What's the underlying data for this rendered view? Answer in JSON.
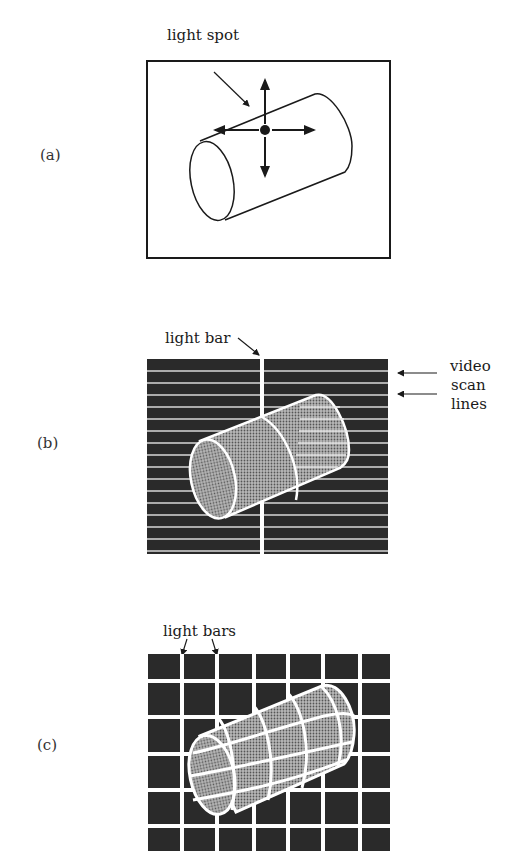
{
  "figure": {
    "panels": [
      {
        "id": "a",
        "label": "(a)",
        "annotations": [
          "light spot"
        ],
        "background": "#ffffff",
        "description": "cylinder on white field with single light spot and four directional arrows"
      },
      {
        "id": "b",
        "label": "(b)",
        "annotations": [
          "light bar",
          "video",
          "scan",
          "lines"
        ],
        "background": "#2a2a2a",
        "description": "cylinder on dark field with horizontal video scan lines and one vertical light bar"
      },
      {
        "id": "c",
        "label": "(c)",
        "annotations": [
          "light bars"
        ],
        "background": "#2a2a2a",
        "description": "cylinder on dark field with grid of vertical and horizontal light bars"
      }
    ]
  },
  "colors": {
    "ink": "#1a1a1a",
    "dark_field": "#2a2a2a",
    "light": "#ffffff",
    "cylinder_fill": "#8a8a8a"
  }
}
